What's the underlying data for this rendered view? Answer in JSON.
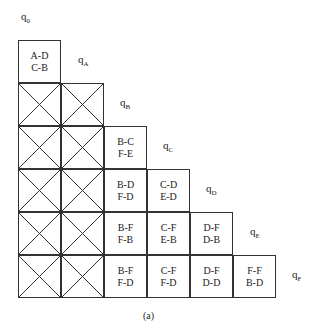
{
  "diagram": {
    "type": "implication-table",
    "state_labels": [
      {
        "id": "q0",
        "base": "q",
        "sub": "0",
        "x": 21,
        "y": 10
      },
      {
        "id": "qA",
        "base": "q",
        "sub": "A",
        "x": 78,
        "y": 53
      },
      {
        "id": "qB",
        "base": "q",
        "sub": "B",
        "x": 120,
        "y": 96
      },
      {
        "id": "qC",
        "base": "q",
        "sub": "C",
        "x": 163,
        "y": 139
      },
      {
        "id": "qD",
        "base": "q",
        "sub": "D",
        "x": 206,
        "y": 182
      },
      {
        "id": "qE",
        "base": "q",
        "sub": "E",
        "x": 250,
        "y": 225
      },
      {
        "id": "qF",
        "base": "q",
        "sub": "F",
        "x": 292,
        "y": 268
      }
    ],
    "cell_size": 43,
    "origin": {
      "x": 18,
      "y": 40
    },
    "rows": [
      {
        "row": "A",
        "cells": [
          {
            "col": "0",
            "crossed": false,
            "line1": "A-D",
            "line2": "C-B"
          }
        ]
      },
      {
        "row": "B",
        "cells": [
          {
            "col": "0",
            "crossed": true,
            "line1": "",
            "line2": ""
          },
          {
            "col": "A",
            "crossed": true,
            "line1": "",
            "line2": ""
          }
        ]
      },
      {
        "row": "C",
        "cells": [
          {
            "col": "0",
            "crossed": true,
            "line1": "",
            "line2": ""
          },
          {
            "col": "A",
            "crossed": true,
            "line1": "",
            "line2": ""
          },
          {
            "col": "B",
            "crossed": false,
            "line1": "B-C",
            "line2": "F-E"
          }
        ]
      },
      {
        "row": "D",
        "cells": [
          {
            "col": "0",
            "crossed": true,
            "line1": "",
            "line2": ""
          },
          {
            "col": "A",
            "crossed": true,
            "line1": "",
            "line2": ""
          },
          {
            "col": "B",
            "crossed": false,
            "line1": "B-D",
            "line2": "F-D"
          },
          {
            "col": "C",
            "crossed": false,
            "line1": "C-D",
            "line2": "E-D"
          }
        ]
      },
      {
        "row": "E",
        "cells": [
          {
            "col": "0",
            "crossed": true,
            "line1": "",
            "line2": ""
          },
          {
            "col": "A",
            "crossed": true,
            "line1": "",
            "line2": ""
          },
          {
            "col": "B",
            "crossed": false,
            "line1": "B-F",
            "line2": "F-B"
          },
          {
            "col": "C",
            "crossed": false,
            "line1": "C-F",
            "line2": "E-B"
          },
          {
            "col": "D",
            "crossed": false,
            "line1": "D-F",
            "line2": "D-B"
          }
        ]
      },
      {
        "row": "F",
        "cells": [
          {
            "col": "0",
            "crossed": true,
            "line1": "",
            "line2": ""
          },
          {
            "col": "A",
            "crossed": true,
            "line1": "",
            "line2": ""
          },
          {
            "col": "B",
            "crossed": false,
            "line1": "B-F",
            "line2": "F-D"
          },
          {
            "col": "C",
            "crossed": false,
            "line1": "C-F",
            "line2": "F-D"
          },
          {
            "col": "D",
            "crossed": false,
            "line1": "D-F",
            "line2": "D-D"
          },
          {
            "col": "E",
            "crossed": false,
            "line1": "F-F",
            "line2": "B-D"
          }
        ]
      }
    ],
    "caption": "(a)",
    "colors": {
      "line": "#333333",
      "text": "#222222",
      "background": "#ffffff"
    }
  }
}
